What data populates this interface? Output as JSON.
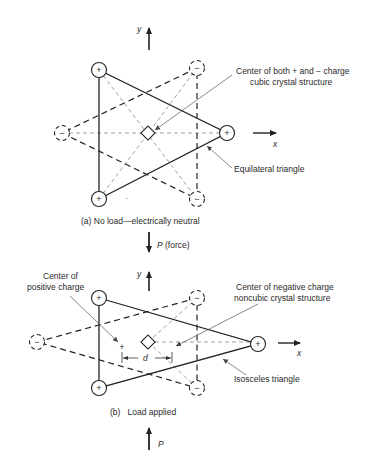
{
  "figure": {
    "panel_a": {
      "caption": "(a)  No load—electrically neutral",
      "axis_y_label": "y",
      "axis_x_label": "x",
      "annotation_center_line1": "Center of both + and − charge",
      "annotation_center_line2": "cubic crystal structure",
      "annotation_triangle": "Equilateral triangle",
      "positive_symbol": "+",
      "negative_symbol": "−",
      "positive_ions": [
        [
          99,
          70
        ],
        [
          99,
          199
        ],
        [
          227,
          133
        ]
      ],
      "negative_ions": [
        [
          197,
          68
        ],
        [
          62,
          133
        ],
        [
          197,
          199
        ]
      ],
      "center": [
        148,
        133
      ]
    },
    "force_top": {
      "label": "P (force)",
      "symbol": "P",
      "suffix": "(force)"
    },
    "panel_b": {
      "caption": "(b)   Load applied",
      "axis_y_label": "y",
      "axis_x_label": "x",
      "annotation_pos_line1": "Center of",
      "annotation_pos_line2": "positive charge",
      "annotation_neg_line1": "Center of negative charge",
      "annotation_neg_line2": "noncubic crystal structure",
      "annotation_triangle": "Isosceles triangle",
      "dimension_label": "d",
      "positive_symbol": "+",
      "negative_symbol": "−",
      "positive_ions": [
        [
          99,
          298
        ],
        [
          99,
          388
        ],
        [
          258,
          344
        ]
      ],
      "negative_ions": [
        [
          197,
          298
        ],
        [
          37,
          342
        ],
        [
          197,
          388
        ]
      ],
      "center_negative": [
        148,
        342
      ],
      "center_positive": [
        122,
        347
      ]
    },
    "force_bottom": {
      "label": "P"
    }
  }
}
